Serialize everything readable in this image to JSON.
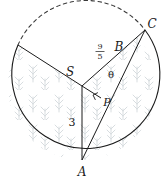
{
  "figure": {
    "type": "geometry-diagram",
    "canvas": {
      "width": 163,
      "height": 179
    },
    "colors": {
      "stroke": "#1a1a1a",
      "texture": "#d8dde0",
      "background": "#ffffff",
      "dashed_stroke": "#3a3a3a"
    }
  },
  "circle": {
    "center_label": "S",
    "cx": 82,
    "cy": 86,
    "r": 74,
    "solid_arc_description": "lower major arc",
    "dashed_arc_description": "upper minor arc"
  },
  "points": [
    {
      "name": "S",
      "label": "S",
      "x": 82,
      "y": 86,
      "label_x": 70,
      "label_y": 76,
      "role": "center"
    },
    {
      "name": "A",
      "label": "A",
      "x": 82,
      "y": 160,
      "label_x": 82,
      "label_y": 176,
      "role": "on-circle"
    },
    {
      "name": "B",
      "label": "B",
      "x": 118,
      "y": 56,
      "label_x": 119,
      "label_y": 51,
      "role": "on-radius-SC"
    },
    {
      "name": "C",
      "label": "C",
      "x": 145,
      "y": 30,
      "label_x": 152,
      "label_y": 28,
      "role": "on-circle"
    },
    {
      "name": "P",
      "label": "P",
      "x": 101,
      "y": 98,
      "label_x": 107,
      "label_y": 106,
      "role": "foot-of-perpendicular"
    },
    {
      "name": "D",
      "label": "",
      "x": 18,
      "y": 45,
      "label_x": 0,
      "label_y": 0,
      "role": "on-circle"
    }
  ],
  "segments": [
    {
      "name": "radius-S-to-D",
      "from": "S",
      "to": "D",
      "style": "solid"
    },
    {
      "name": "radius-S-to-A",
      "from": "S",
      "to": "A",
      "style": "solid"
    },
    {
      "name": "radius-S-to-C",
      "from": "S",
      "to": "C",
      "style": "solid"
    },
    {
      "name": "chord-A-to-C",
      "from": "A",
      "to": "C",
      "style": "solid"
    },
    {
      "name": "perpendicular-S-to-P",
      "from": "S",
      "to": "P",
      "style": "solid"
    }
  ],
  "labels": {
    "radius_length": {
      "text": "3",
      "x": 72,
      "y": 126,
      "element": "segment SA"
    },
    "angle_theta": {
      "text": "θ",
      "x": 111,
      "y": 78,
      "element": "angle SBP at vertex B"
    },
    "fraction_SB": {
      "numerator": "9",
      "denominator": "5",
      "x": 100,
      "y": 52,
      "element": "segment SB"
    }
  },
  "markers": {
    "right_angle": {
      "name": "right-angle-marker",
      "vertex": "P",
      "x": 101,
      "y": 98,
      "size": 6,
      "description": "square marker indicating SP perpendicular to AC"
    }
  },
  "shading": {
    "description": "light gray grass/plant texture fill inside the two lower sectors",
    "color": "#d8dde0"
  }
}
